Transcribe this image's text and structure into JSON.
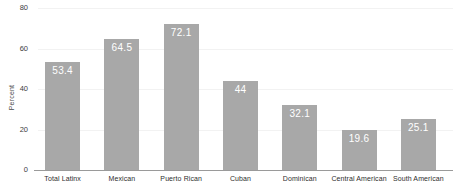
{
  "chart_data": {
    "type": "bar",
    "title": "",
    "subtitle": "",
    "xlabel": "",
    "ylabel": "Percent",
    "ylim": [
      0,
      80
    ],
    "yticks": [
      0,
      20,
      40,
      60,
      80
    ],
    "ytick_labels": [
      "0",
      "20",
      "40",
      "60",
      "80"
    ],
    "grid": true,
    "legend": false,
    "legend_position": "none",
    "bar_color": "#a8a8a8",
    "value_label_color": "#ffffff",
    "categories": [
      "Total Latinx",
      "Mexican",
      "Puerto Rican",
      "Cuban",
      "Dominican",
      "Central American",
      "South American"
    ],
    "values": [
      53.4,
      64.5,
      72.1,
      44,
      32.1,
      19.6,
      25.1
    ],
    "value_labels": [
      "53.4",
      "64.5",
      "72.1",
      "44",
      "32.1",
      "19.6",
      "25.1"
    ]
  }
}
